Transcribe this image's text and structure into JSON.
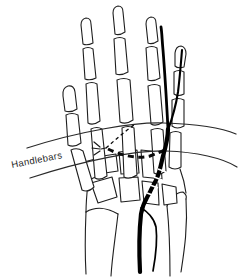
{
  "diagram": {
    "label": "Handlebars"
  },
  "colors": {
    "background": "#ffffff",
    "bone_outline": "#1f1f1f",
    "artery": "#000000",
    "label_text": "#1f1f1f"
  }
}
